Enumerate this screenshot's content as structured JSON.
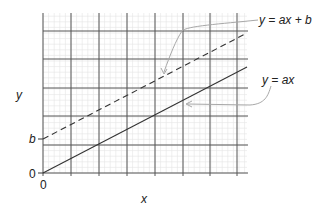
{
  "diagram": {
    "axes": {
      "x_label": "x",
      "y_label": "y",
      "x_origin_label": "0",
      "y_origin_label": "0",
      "y_intercept_label": "b"
    },
    "lines": [
      {
        "name": "y = ax + b",
        "style": "dashed",
        "label": "y = ax + b"
      },
      {
        "name": "y = ax",
        "style": "solid",
        "label": "y = ax"
      }
    ],
    "grid": {
      "major_color": "#555555",
      "minor_color": "#e4e4e4",
      "line_color": "#333333",
      "annotation_color": "#a8a8a8"
    }
  }
}
